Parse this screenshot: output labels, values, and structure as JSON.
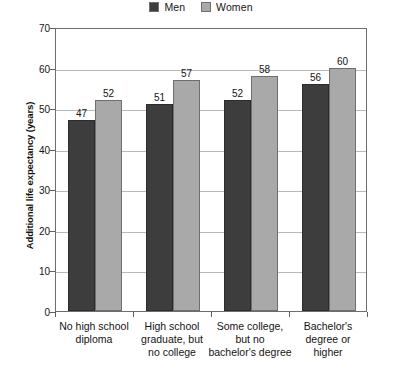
{
  "chart_data": {
    "type": "bar",
    "title": "",
    "xlabel": "",
    "ylabel": "Additional life expectancy (years)",
    "ylim": [
      0,
      70
    ],
    "yticks": [
      0,
      10,
      20,
      30,
      40,
      50,
      60,
      70
    ],
    "grid": true,
    "legend_position": "top-center",
    "categories": [
      "No high school diploma",
      "High school graduate, but no college",
      "Some college, but no bachelor's degree",
      "Bachelor's degree or higher"
    ],
    "category_lines": [
      [
        "No high school",
        "diploma"
      ],
      [
        "High school",
        "graduate, but",
        "no college"
      ],
      [
        "Some college,",
        "but no",
        "bachelor's degree"
      ],
      [
        "Bachelor's",
        "degree or",
        "higher"
      ]
    ],
    "series": [
      {
        "name": "Men",
        "color": "#3d3d3d",
        "values": [
          47,
          51,
          52,
          56
        ]
      },
      {
        "name": "Women",
        "color": "#a9a9a9",
        "values": [
          52,
          57,
          58,
          60
        ]
      }
    ]
  },
  "legend": {
    "entries": [
      {
        "label": "Men",
        "color": "#3d3d3d"
      },
      {
        "label": "Women",
        "color": "#a9a9a9"
      }
    ]
  },
  "axes": {
    "y_title": "Additional life expectancy (years)",
    "y_tick_labels": [
      "70",
      "60",
      "50",
      "40",
      "30",
      "20",
      "10",
      "0"
    ]
  },
  "values": {
    "men": [
      "47",
      "51",
      "52",
      "56"
    ],
    "women": [
      "52",
      "57",
      "58",
      "60"
    ]
  }
}
